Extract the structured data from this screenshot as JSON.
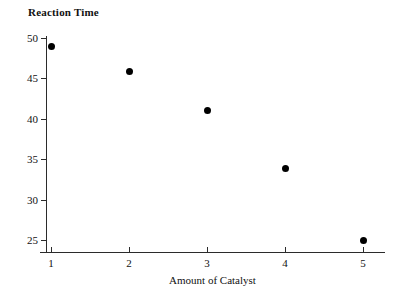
{
  "chart_data": {
    "type": "scatter",
    "title": "",
    "ylabel": "Reaction Time",
    "xlabel": "Amount of Catalyst",
    "x": [
      1,
      2,
      3,
      4,
      5
    ],
    "values": [
      49,
      45.9,
      41,
      33.8,
      25
    ],
    "points": [
      {
        "x": 1,
        "y": 49
      },
      {
        "x": 2,
        "y": 45.9
      },
      {
        "x": 3,
        "y": 41
      },
      {
        "x": 4,
        "y": 33.8
      },
      {
        "x": 5,
        "y": 25
      }
    ],
    "xticks": [
      1,
      2,
      3,
      4,
      5
    ],
    "yticks": [
      25,
      30,
      35,
      40,
      45,
      50
    ],
    "xlim": [
      0.8,
      5.3
    ],
    "ylim": [
      23.4,
      50.3
    ],
    "grid": false,
    "legend": null,
    "marker_color": "#000000",
    "axis_color": "#2b2b2b",
    "background": "#ffffff"
  },
  "axes": {
    "y_title": "Reaction Time",
    "x_title": "Amount of Catalyst",
    "y_tick_labels": [
      "50",
      "45",
      "40",
      "35",
      "30",
      "25"
    ],
    "x_tick_labels": [
      "1",
      "2",
      "3",
      "4",
      "5"
    ]
  }
}
